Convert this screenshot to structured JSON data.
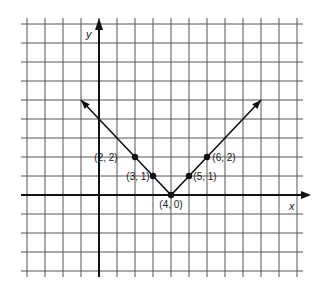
{
  "chart_data": {
    "type": "line",
    "title": "",
    "xlabel": "x",
    "ylabel": "y",
    "xlim": [
      -4,
      11
    ],
    "ylim": [
      -4,
      9
    ],
    "grid": true,
    "legend": null,
    "series": [
      {
        "name": "y = |x - 4|",
        "x": [
          -1,
          2,
          3,
          4,
          5,
          6,
          9
        ],
        "y": [
          5,
          2,
          1,
          0,
          1,
          2,
          5
        ],
        "arrows_at_ends": true
      }
    ],
    "points": [
      {
        "x": 2,
        "y": 2,
        "label": "(2, 2)"
      },
      {
        "x": 3,
        "y": 1,
        "label": "(3, 1)"
      },
      {
        "x": 4,
        "y": 0,
        "label": "(4, 0)"
      },
      {
        "x": 5,
        "y": 1,
        "label": "(5, 1)"
      },
      {
        "x": 6,
        "y": 2,
        "label": "(6, 2)"
      }
    ]
  },
  "axes": {
    "x_label": "x",
    "y_label": "y"
  },
  "labels": {
    "p22": "(2, 2)",
    "p31": "(3, 1)",
    "p40": "(4, 0)",
    "p51": "(5, 1)",
    "p62": "(6, 2)"
  }
}
